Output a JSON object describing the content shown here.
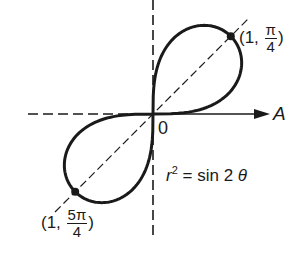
{
  "diagram": {
    "type": "polar-curve",
    "equation_label": {
      "lhs": "r",
      "exp": "2",
      "rhs": "= sin 2",
      "theta": "θ"
    },
    "origin_label": "0",
    "axis_label": "A",
    "curve": "lemniscate r^2 = sin 2θ",
    "points": [
      {
        "id": "upper",
        "open": "(1,",
        "num": "π",
        "den": "4",
        "close": ")"
      },
      {
        "id": "lower",
        "open": "(1,",
        "num": "5π",
        "den": "4",
        "close": ")"
      }
    ],
    "colors": {
      "stroke": "#1a1a1a",
      "background": "#ffffff"
    }
  }
}
